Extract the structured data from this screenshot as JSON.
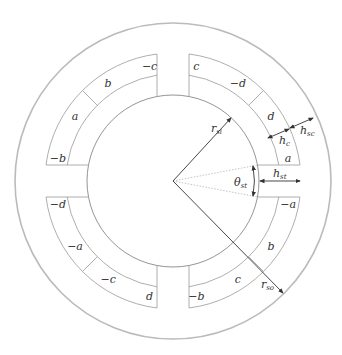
{
  "diagram": {
    "center": [
      173,
      181
    ],
    "outer_radius": 158,
    "bore_radius": 86,
    "slot_outer_radius": 128,
    "coil_split_radius": 107,
    "tooth_half_width": 16,
    "colors": {
      "outline": "#999999",
      "outer_ring": "#bbbbbb",
      "dimension": "#333333",
      "dotted": "#aaaaaa"
    },
    "slots": [
      {
        "id": "slot-upper-left",
        "coils": [
          {
            "label": "b"
          },
          {
            "label": "−c"
          }
        ]
      },
      {
        "id": "slot-upper-right",
        "coils": [
          {
            "label": "c"
          },
          {
            "label": "−d"
          }
        ]
      },
      {
        "id": "slot-right-upper",
        "coils": [
          {
            "label": "d"
          },
          {
            "label": "a"
          }
        ]
      },
      {
        "id": "slot-right-lower",
        "coils": [
          {
            "label": "−a"
          },
          {
            "label": "b"
          }
        ]
      },
      {
        "id": "slot-lower-right",
        "coils": [
          {
            "label": "c"
          },
          {
            "label": "−b"
          }
        ]
      },
      {
        "id": "slot-lower-left",
        "coils": [
          {
            "label": "d"
          },
          {
            "label": "−c"
          }
        ]
      },
      {
        "id": "slot-left-lower",
        "coils": [
          {
            "label": "−a"
          },
          {
            "label": "−d"
          }
        ]
      },
      {
        "id": "slot-left-upper",
        "coils": [
          {
            "label": "−b"
          },
          {
            "label": "a"
          }
        ]
      }
    ],
    "dimensions": {
      "r_si": {
        "symbol": "r",
        "subscript": "si"
      },
      "r_so": {
        "symbol": "r",
        "subscript": "so"
      },
      "h_c": {
        "symbol": "h",
        "subscript": "c"
      },
      "h_sc": {
        "symbol": "h",
        "subscript": "sc"
      },
      "h_st": {
        "symbol": "h",
        "subscript": "st"
      },
      "theta_st": {
        "symbol": "θ",
        "subscript": "st"
      }
    }
  }
}
